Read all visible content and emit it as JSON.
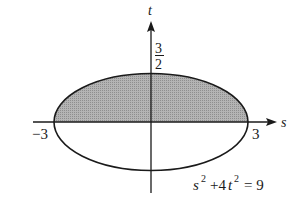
{
  "diagram": {
    "type": "ellipse-region",
    "equation": {
      "s_term": "s",
      "s_exp": "2",
      "plus_term": "+4",
      "t_term": "t",
      "t_exp": "2",
      "rhs": "= 9"
    },
    "axes": {
      "horizontal_label": "s",
      "vertical_label": "t"
    },
    "ticks": {
      "s_negative": "−3",
      "s_positive": "3",
      "t_numerator": "3",
      "t_denominator": "2"
    },
    "shaded_region": "upper half of ellipse (t ≥ 0)",
    "colors": {
      "stroke": "#1a1a1a",
      "shade": "#a8a8a8",
      "background": "#ffffff"
    }
  }
}
